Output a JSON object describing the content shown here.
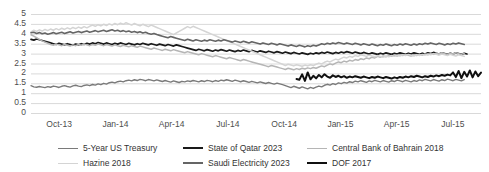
{
  "chart_data": {
    "type": "line",
    "title": "",
    "xlabel": "",
    "ylabel": "",
    "ylim": [
      0,
      5
    ],
    "ytick_values": [
      0,
      0.5,
      1,
      1.5,
      2,
      2.5,
      3,
      3.5,
      4,
      4.5,
      5
    ],
    "ytick_labels": [
      "0",
      "0.5",
      "1",
      "1.5",
      "2",
      "2.5",
      "3",
      "3.5",
      "4",
      "4.5",
      "5"
    ],
    "xtick_labels": [
      "Oct-13",
      "Jan-14",
      "Apr-14",
      "Jul-14",
      "Oct-14",
      "Jan-15",
      "Apr-15",
      "Jul-15"
    ],
    "grid": true,
    "legend_position": "bottom",
    "series": [
      {
        "name": "5-Year US Treasury",
        "color": "#7a7a7a",
        "width": 1.4,
        "values": [
          1.38,
          1.32,
          1.3,
          1.34,
          1.31,
          1.28,
          1.33,
          1.3,
          1.36,
          1.33,
          1.29,
          1.35,
          1.38,
          1.34,
          1.31,
          1.37,
          1.4,
          1.36,
          1.33,
          1.39,
          1.42,
          1.38,
          1.44,
          1.41,
          1.47,
          1.43,
          1.5,
          1.46,
          1.53,
          1.56,
          1.52,
          1.58,
          1.61,
          1.57,
          1.63,
          1.66,
          1.62,
          1.68,
          1.64,
          1.7,
          1.67,
          1.63,
          1.69,
          1.66,
          1.62,
          1.67,
          1.63,
          1.59,
          1.64,
          1.6,
          1.56,
          1.62,
          1.58,
          1.54,
          1.6,
          1.57,
          1.62,
          1.59,
          1.64,
          1.61,
          1.57,
          1.63,
          1.59,
          1.65,
          1.62,
          1.58,
          1.64,
          1.6,
          1.66,
          1.63,
          1.68,
          1.64,
          1.6,
          1.66,
          1.62,
          1.58,
          1.63,
          1.59,
          1.55,
          1.6,
          1.56,
          1.52,
          1.57,
          1.53,
          1.49,
          1.54,
          1.5,
          1.46,
          1.51,
          1.47,
          1.43,
          1.38,
          1.33,
          1.28,
          1.35,
          1.3,
          1.25,
          1.32,
          1.27,
          1.22,
          1.29,
          1.24,
          1.31,
          1.36,
          1.32,
          1.4,
          1.45,
          1.41,
          1.48,
          1.44,
          1.52,
          1.48,
          1.55,
          1.51,
          1.58,
          1.54,
          1.61,
          1.57,
          1.63,
          1.59,
          1.55,
          1.62,
          1.58,
          1.65,
          1.61,
          1.57,
          1.64,
          1.6,
          1.56,
          1.63,
          1.59,
          1.66,
          1.62,
          1.58,
          1.65,
          1.61,
          1.57,
          1.64,
          1.6,
          1.67,
          1.63,
          1.7,
          1.66,
          1.62,
          1.69,
          1.65,
          1.61,
          1.68,
          1.64,
          1.71,
          1.67,
          1.63,
          1.7,
          1.66,
          1.62,
          1.69
        ]
      },
      {
        "name": "State of Qatar 2023",
        "color": "#1a1a1a",
        "width": 1.7,
        "values": [
          3.72,
          3.68,
          3.74,
          3.7,
          3.66,
          3.62,
          3.58,
          3.54,
          3.5,
          3.46,
          3.52,
          3.48,
          3.44,
          3.5,
          3.46,
          3.42,
          3.48,
          3.44,
          3.5,
          3.46,
          3.52,
          3.48,
          3.54,
          3.5,
          3.56,
          3.52,
          3.48,
          3.54,
          3.5,
          3.46,
          3.52,
          3.48,
          3.54,
          3.5,
          3.46,
          3.52,
          3.48,
          3.44,
          3.5,
          3.46,
          3.52,
          3.48,
          3.44,
          3.5,
          3.46,
          3.42,
          3.48,
          3.44,
          3.4,
          3.46,
          3.42,
          3.38,
          3.44,
          3.4,
          3.36,
          3.32,
          3.28,
          3.24,
          3.2,
          3.16,
          3.22,
          3.18,
          3.14,
          3.2,
          3.16,
          3.12,
          3.18,
          3.14,
          3.2,
          3.16,
          3.12,
          3.18,
          3.14,
          3.1,
          3.16,
          3.12,
          3.18,
          3.14,
          3.1,
          3.16,
          3.12,
          3.08,
          3.14,
          3.1,
          3.06,
          3.12,
          3.08,
          3.04,
          3.1,
          3.06,
          3.02,
          3.08,
          3.04,
          3.0,
          3.06,
          3.02,
          2.98,
          3.04,
          3.0,
          2.96,
          3.02,
          2.98,
          3.04,
          3.0,
          3.06,
          3.02,
          3.08,
          3.04,
          3.0,
          3.06,
          3.02,
          3.08,
          3.04,
          3.1,
          3.06,
          3.02,
          3.08,
          3.04,
          3.0,
          3.06,
          3.02,
          2.98,
          3.04,
          3.0,
          2.96,
          3.02,
          2.98,
          3.04,
          3.0,
          2.96,
          3.02,
          2.98,
          3.04,
          3.0,
          2.96,
          3.02,
          2.98,
          3.04,
          3.0,
          2.96,
          3.02,
          2.98,
          3.04,
          3.0,
          3.06,
          3.02,
          2.98,
          3.04,
          3.0,
          2.96,
          3.02,
          2.98,
          3.04,
          3.0,
          2.96,
          3.02,
          2.98
        ]
      },
      {
        "name": "Central Bank of Bahrain 2018",
        "color": "#b5b5b5",
        "width": 1.5,
        "values": [
          3.95,
          3.88,
          3.8,
          3.72,
          3.64,
          3.58,
          3.52,
          3.46,
          3.42,
          3.48,
          3.44,
          3.4,
          3.46,
          3.42,
          3.38,
          3.44,
          3.4,
          3.46,
          3.42,
          3.48,
          3.44,
          3.4,
          3.46,
          3.42,
          3.48,
          3.44,
          3.4,
          3.46,
          3.42,
          3.38,
          3.44,
          3.4,
          3.36,
          3.42,
          3.38,
          3.34,
          3.4,
          3.36,
          3.32,
          3.38,
          3.34,
          3.3,
          3.26,
          3.22,
          3.28,
          3.24,
          3.2,
          3.16,
          3.22,
          3.18,
          3.14,
          3.2,
          3.16,
          3.12,
          3.08,
          3.04,
          3.1,
          3.06,
          3.02,
          2.98,
          2.94,
          3.0,
          2.96,
          2.92,
          2.88,
          2.84,
          2.9,
          2.86,
          2.82,
          2.78,
          2.74,
          2.8,
          2.76,
          2.72,
          2.68,
          2.64,
          2.7,
          2.66,
          2.62,
          2.58,
          2.54,
          2.5,
          2.46,
          2.42,
          2.38,
          2.34,
          2.4,
          2.36,
          2.32,
          2.28,
          2.24,
          2.2,
          2.26,
          2.22,
          2.18,
          2.24,
          2.2,
          2.26,
          2.22,
          2.28,
          2.24,
          2.3,
          2.26,
          2.32,
          2.38,
          2.34,
          2.42,
          2.48,
          2.44,
          2.52,
          2.58,
          2.54,
          2.62,
          2.58,
          2.66,
          2.62,
          2.7,
          2.66,
          2.74,
          2.7,
          2.78,
          2.74,
          2.82,
          2.78,
          2.86,
          2.82,
          2.88,
          2.84,
          2.9,
          2.86,
          2.92,
          2.88,
          2.94,
          2.9,
          2.96,
          2.92,
          2.88,
          2.94,
          2.9,
          2.96,
          2.92,
          2.98,
          2.94,
          3.0,
          2.96,
          3.02,
          2.98,
          3.04,
          3.0,
          2.96,
          3.02,
          2.98,
          3.04,
          3.0,
          2.96,
          3.02
        ]
      },
      {
        "name": "Hazine 2018",
        "color": "#d4d4d4",
        "width": 1.5,
        "values": [
          4.1,
          4.18,
          4.12,
          4.2,
          4.14,
          4.22,
          4.16,
          4.24,
          4.18,
          4.26,
          4.2,
          4.28,
          4.22,
          4.3,
          4.24,
          4.32,
          4.26,
          4.34,
          4.28,
          4.36,
          4.3,
          4.38,
          4.44,
          4.38,
          4.46,
          4.4,
          4.48,
          4.42,
          4.5,
          4.44,
          4.52,
          4.46,
          4.54,
          4.48,
          4.56,
          4.5,
          4.44,
          4.52,
          4.46,
          4.4,
          4.48,
          4.42,
          4.36,
          4.44,
          4.38,
          4.32,
          4.26,
          4.2,
          4.14,
          4.08,
          4.02,
          3.96,
          4.04,
          4.12,
          4.2,
          4.28,
          4.36,
          4.3,
          4.38,
          4.32,
          4.26,
          4.2,
          4.14,
          4.08,
          4.02,
          3.96,
          3.9,
          3.84,
          3.78,
          3.72,
          3.66,
          3.6,
          3.54,
          3.48,
          3.42,
          3.36,
          3.3,
          3.24,
          3.18,
          3.12,
          3.06,
          3.0,
          2.94,
          2.88,
          2.82,
          2.76,
          2.7,
          2.64,
          2.58,
          2.52,
          2.46,
          2.4,
          2.46,
          2.42,
          2.38,
          2.44,
          2.4,
          2.36,
          2.42,
          2.38,
          2.44,
          2.4,
          2.46,
          2.52,
          2.48,
          2.56,
          2.62,
          2.58,
          2.66,
          2.72,
          2.68,
          2.76,
          2.82,
          2.78,
          2.86,
          2.82,
          2.9,
          2.86,
          2.94,
          2.9,
          2.86,
          2.92,
          2.88,
          2.84,
          2.9,
          2.86,
          2.82,
          2.88,
          2.84,
          2.9,
          2.86,
          2.92,
          2.88,
          2.94,
          2.9,
          2.96,
          2.92,
          2.88,
          2.94,
          2.9,
          2.96,
          2.92,
          2.98,
          2.94,
          3.0,
          2.96,
          2.92,
          2.98,
          2.94,
          2.9,
          2.96,
          2.92,
          2.88,
          2.94,
          2.9,
          2.86
        ]
      },
      {
        "name": "Saudi Electricity 2023",
        "color": "#656565",
        "width": 1.6,
        "values": [
          4.05,
          4.08,
          4.02,
          4.06,
          4.0,
          4.04,
          3.98,
          4.02,
          4.06,
          4.0,
          4.04,
          4.08,
          4.02,
          4.06,
          4.1,
          4.04,
          4.08,
          4.12,
          4.06,
          4.1,
          4.14,
          4.08,
          4.12,
          4.16,
          4.1,
          4.14,
          4.18,
          4.12,
          4.16,
          4.2,
          4.14,
          4.18,
          4.12,
          4.16,
          4.1,
          4.14,
          4.08,
          4.12,
          4.06,
          4.1,
          4.04,
          4.08,
          4.02,
          3.98,
          4.02,
          3.96,
          3.92,
          3.88,
          3.84,
          3.8,
          3.86,
          3.82,
          3.78,
          3.74,
          3.7,
          3.66,
          3.72,
          3.68,
          3.64,
          3.7,
          3.66,
          3.62,
          3.68,
          3.64,
          3.7,
          3.66,
          3.62,
          3.68,
          3.64,
          3.7,
          3.66,
          3.62,
          3.58,
          3.64,
          3.6,
          3.56,
          3.62,
          3.58,
          3.54,
          3.6,
          3.56,
          3.52,
          3.48,
          3.54,
          3.5,
          3.46,
          3.52,
          3.48,
          3.44,
          3.5,
          3.46,
          3.42,
          3.38,
          3.44,
          3.4,
          3.36,
          3.42,
          3.38,
          3.34,
          3.4,
          3.36,
          3.42,
          3.38,
          3.44,
          3.5,
          3.46,
          3.52,
          3.48,
          3.54,
          3.5,
          3.56,
          3.52,
          3.48,
          3.54,
          3.5,
          3.46,
          3.52,
          3.48,
          3.44,
          3.5,
          3.46,
          3.42,
          3.48,
          3.44,
          3.4,
          3.46,
          3.42,
          3.48,
          3.44,
          3.4,
          3.46,
          3.42,
          3.48,
          3.44,
          3.5,
          3.46,
          3.42,
          3.48,
          3.44,
          3.5,
          3.46,
          3.52,
          3.48,
          3.54,
          3.5,
          3.46,
          3.52,
          3.48,
          3.44,
          3.5,
          3.46,
          3.52,
          3.48,
          3.54,
          3.5,
          3.46
        ]
      },
      {
        "name": "DOF 2017",
        "color": "#101010",
        "width": 2.0,
        "start_index": 95,
        "values": [
          1.72,
          1.68,
          1.95,
          1.62,
          2.05,
          1.7,
          1.88,
          1.75,
          1.92,
          1.8,
          1.96,
          1.84,
          1.78,
          1.9,
          1.82,
          1.88,
          1.8,
          1.86,
          1.78,
          1.84,
          1.8,
          1.86,
          1.82,
          1.78,
          1.84,
          1.8,
          1.76,
          1.82,
          1.78,
          1.84,
          1.8,
          1.76,
          1.82,
          1.78,
          1.74,
          1.8,
          1.76,
          1.82,
          1.78,
          1.84,
          1.8,
          1.86,
          1.82,
          1.88,
          1.84,
          1.8,
          1.86,
          1.82,
          1.88,
          1.84,
          1.9,
          1.86,
          1.92,
          1.88,
          1.94,
          1.9,
          2.05,
          1.82,
          2.12,
          1.76,
          2.08,
          1.84,
          2.15,
          1.8,
          2.1,
          1.86,
          2.04
        ]
      }
    ]
  },
  "axis": {
    "y_labels": [
      "5",
      "4.5",
      "4",
      "3.5",
      "3",
      "2.5",
      "2",
      "1.5",
      "1",
      "0.5",
      "0"
    ],
    "x_labels": [
      "Oct-13",
      "Jan-14",
      "Apr-14",
      "Jul-14",
      "Oct-14",
      "Jan-15",
      "Apr-15",
      "Jul-15"
    ]
  },
  "legend": {
    "items": [
      {
        "label": "5-Year US Treasury",
        "color": "#7a7a7a",
        "width": 1.8
      },
      {
        "label": "State of Qatar 2023",
        "color": "#1a1a1a",
        "width": 2.2
      },
      {
        "label": "Central Bank of Bahrain 2018",
        "color": "#b5b5b5",
        "width": 1.8
      },
      {
        "label": "Hazine 2018",
        "color": "#d4d4d4",
        "width": 1.8
      },
      {
        "label": "Saudi Electricity 2023",
        "color": "#656565",
        "width": 2.0
      },
      {
        "label": "DOF 2017",
        "color": "#101010",
        "width": 2.6
      }
    ]
  },
  "style": {
    "grid_color": "#d9d9d9",
    "text_color": "#4d4d4d",
    "background": "#ffffff"
  }
}
